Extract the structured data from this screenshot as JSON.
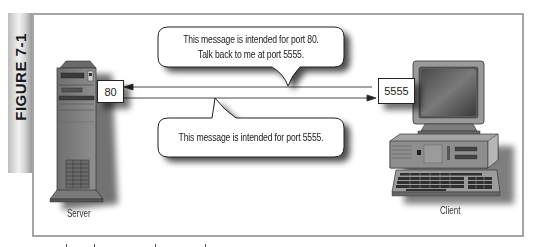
{
  "figure": {
    "label": "FIGURE 7-1"
  },
  "server": {
    "label": "Server",
    "port": "80"
  },
  "client": {
    "label": "Client",
    "port": "5555"
  },
  "messages": {
    "request": {
      "line1": "This message is intended for port 80.",
      "line2": "Talk back to me at port 5555.",
      "direction": "client-to-server"
    },
    "response": {
      "line1": "This message is intended for port 5555.",
      "direction": "server-to-client"
    }
  },
  "colors": {
    "frame_border": "#a5a5a5",
    "line": "#333333",
    "device_body": "#8a8a8a",
    "device_dark": "#5e5e5e",
    "shadow": "#000000"
  }
}
